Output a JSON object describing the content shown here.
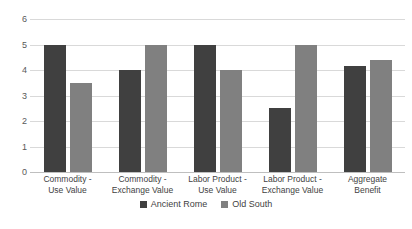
{
  "chart_data": {
    "type": "bar",
    "title": "",
    "subtitle": "",
    "xlabel": "",
    "ylabel": "",
    "ylim": [
      0,
      6
    ],
    "ytick_step": 1,
    "yticks": [
      "6",
      "5",
      "4",
      "3",
      "2",
      "1",
      "0"
    ],
    "grid": true,
    "legend_position": "bottom-center",
    "categories": [
      "Commodity - Use Value",
      "Commodity - Exchange Value",
      "Labor Product - Use Value",
      "Labor Product - Exchange Value",
      "Aggregate Benefit"
    ],
    "category_lines": [
      [
        "Commodity -",
        "Use Value"
      ],
      [
        "Commodity -",
        "Exchange Value"
      ],
      [
        "Labor Product -",
        "Use Value"
      ],
      [
        "Labor Product -",
        "Exchange Value"
      ],
      [
        "Aggregate",
        "Benefit"
      ]
    ],
    "series": [
      {
        "name": "Ancient Rome",
        "color": "#404040",
        "values": [
          5,
          4,
          5,
          2.5,
          4.15
        ]
      },
      {
        "name": "Old South",
        "color": "#808080",
        "values": [
          3.5,
          5,
          4,
          5,
          4.4
        ]
      }
    ]
  },
  "colors": {
    "series_0": "#404040",
    "series_1": "#808080",
    "gridline": "#d9d9d9",
    "axis": "#bfbfbf",
    "text": "#3f3f3f",
    "background": "#ffffff"
  }
}
